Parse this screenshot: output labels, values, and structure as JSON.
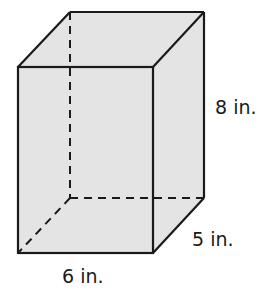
{
  "figure": {
    "type": "rectangular prism",
    "fill_color": "#e4e4e4",
    "edge_color": "#1a1a1a",
    "dimensions": {
      "height": "8 in.",
      "depth": "5 in.",
      "width": "6 in."
    }
  }
}
